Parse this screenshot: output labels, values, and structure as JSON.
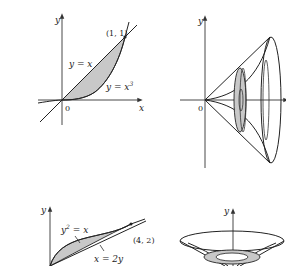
{
  "figures": [
    {
      "id": "region-between-curves",
      "labels": {
        "y_axis": "y",
        "x_axis": "x",
        "origin": "0",
        "point": "(1, 1)",
        "curve_upper": "y = x",
        "curve_lower": "y = x",
        "curve_lower_exp": "3"
      }
    },
    {
      "id": "solid-of-revolution-x-axis",
      "labels": {
        "y_axis": "y",
        "origin": "0"
      }
    },
    {
      "id": "region-parabola-line",
      "labels": {
        "y_axis": "y",
        "curve_upper": "y",
        "curve_upper_exp": "2",
        "curve_upper_rest": " = x",
        "curve_lower": "x = 2y",
        "point": "(4, 2)"
      }
    },
    {
      "id": "solid-of-revolution-y-axis",
      "labels": {
        "y_axis": "y"
      }
    }
  ],
  "colors": {
    "shade": "#c8c8c8",
    "stroke": "#222222",
    "background": "#ffffff"
  }
}
